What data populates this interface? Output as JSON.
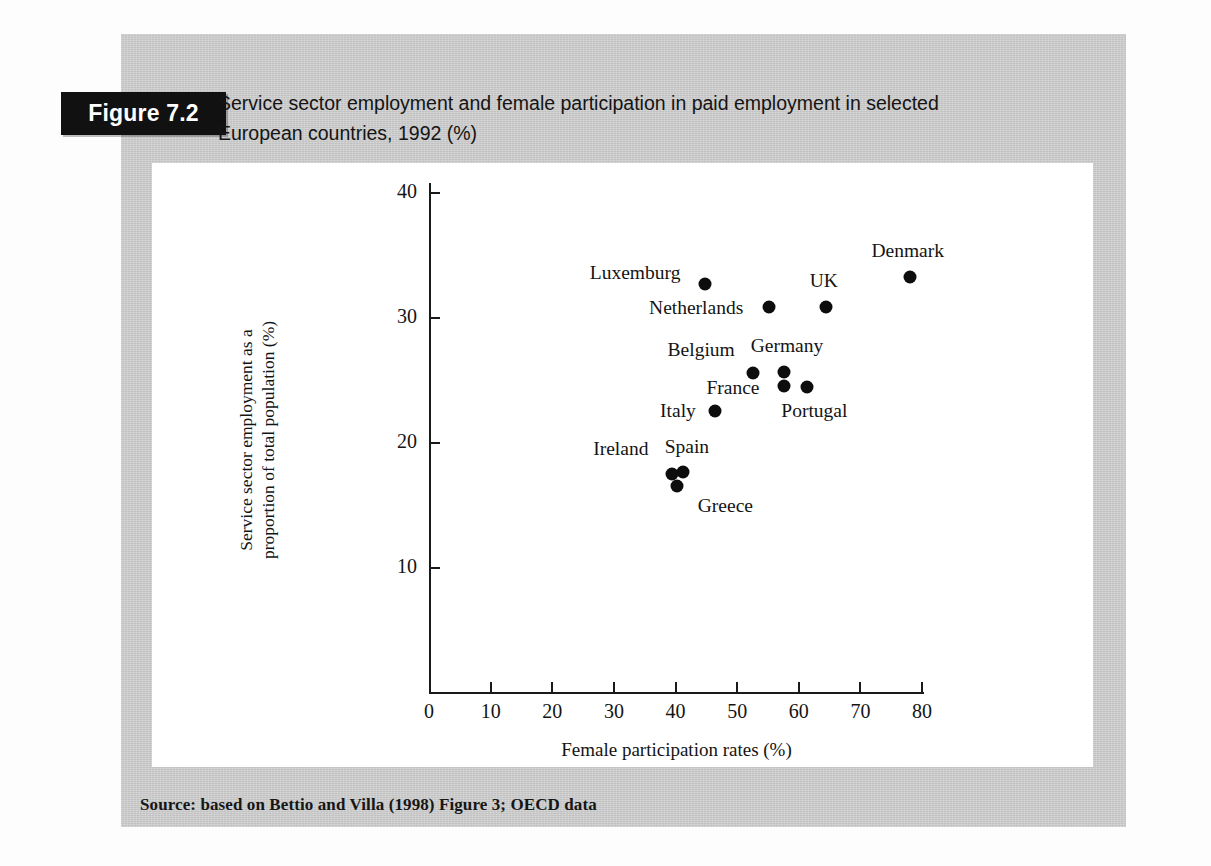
{
  "figure": {
    "tab_label": "Figure 7.2",
    "caption_line1": "Service sector employment and female participation in paid employment in selected",
    "caption_line2": "European countries, 1992 (%)",
    "source": "Source: based on Bettio and Villa (1998) Figure 3; OECD data"
  },
  "colors": {
    "page_background": "#fdfdfd",
    "panel_background": "#cdcdcd",
    "card_background": "#ffffff",
    "tab_background": "#111111",
    "tab_text": "#ffffff",
    "ink": "#141414",
    "marker": "#0d0d0d"
  },
  "chart_data": {
    "type": "scatter",
    "title": "Service sector employment and female participation in paid employment in selected European countries, 1992 (%)",
    "xlabel": "Female participation rates (%)",
    "ylabel": "Service sector employment as a proportion of total population (%)",
    "ylabel_line1": "Service sector employment as a",
    "ylabel_line2": "proportion of total population (%)",
    "xlim": [
      0,
      80
    ],
    "ylim": [
      0,
      40
    ],
    "xticks": [
      0,
      10,
      20,
      30,
      40,
      50,
      60,
      70,
      80
    ],
    "yticks": [
      10,
      20,
      30,
      40
    ],
    "grid": false,
    "legend": "none",
    "points": [
      {
        "label": "Denmark",
        "x": 78.0,
        "y": 33.3,
        "label_dx": -2,
        "label_dy": -26
      },
      {
        "label": "Luxemburg",
        "x": 44.8,
        "y": 32.7,
        "label_dx": -70,
        "label_dy": -11
      },
      {
        "label": "UK",
        "x": 64.4,
        "y": 30.9,
        "label_dx": -2,
        "label_dy": -26
      },
      {
        "label": "Netherlands",
        "x": 55.2,
        "y": 30.9,
        "label_dx": -73,
        "label_dy": 1
      },
      {
        "label": "Germany",
        "x": 57.6,
        "y": 25.7,
        "label_dx": 3,
        "label_dy": -26
      },
      {
        "label": "Belgium",
        "x": 52.6,
        "y": 25.6,
        "label_dx": -52,
        "label_dy": -23
      },
      {
        "label": "France",
        "x": 57.6,
        "y": 24.6,
        "label_dx": -51,
        "label_dy": 2
      },
      {
        "label": "Portugal",
        "x": 61.4,
        "y": 24.5,
        "label_dx": 7,
        "label_dy": 24
      },
      {
        "label": "Italy",
        "x": 46.4,
        "y": 22.6,
        "label_dx": -37,
        "label_dy": 0
      },
      {
        "label": "Spain",
        "x": 41.2,
        "y": 17.7,
        "label_dx": 4,
        "label_dy": -25
      },
      {
        "label": "Ireland",
        "x": 39.4,
        "y": 17.5,
        "label_dx": -51,
        "label_dy": -25
      },
      {
        "label": "Greece",
        "x": 40.3,
        "y": 16.6,
        "label_dx": 48,
        "label_dy": 20
      }
    ]
  }
}
